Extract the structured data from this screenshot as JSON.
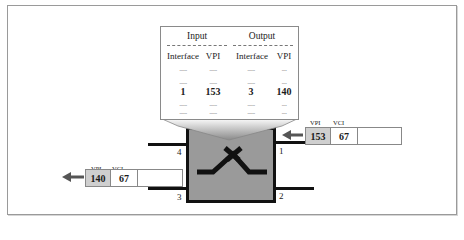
{
  "callout": {
    "input_header": "Input",
    "output_header": "Output",
    "columns": [
      "Interface",
      "VPI",
      "Interface",
      "VPI"
    ],
    "filler_row": [
      "......",
      "......",
      "......",
      "...."
    ],
    "highlight_row": [
      "1",
      "153",
      "3",
      "140"
    ]
  },
  "switch": {
    "ports": {
      "p1": "1",
      "p2": "2",
      "p3": "3",
      "p4": "4"
    }
  },
  "incoming_cell": {
    "vpi_label": "VPI",
    "vci_label": "VCI",
    "vpi": "153",
    "vci": "67",
    "port": "1"
  },
  "outgoing_cell": {
    "vpi_label": "VPI",
    "vci_label": "VCI",
    "vpi": "140",
    "vci": "67",
    "port": "3"
  },
  "colors": {
    "switch_fill": "#9a9a9a",
    "vpi_cell_fill": "#cfcfcf",
    "arrow": "#555555",
    "line": "#111111"
  }
}
